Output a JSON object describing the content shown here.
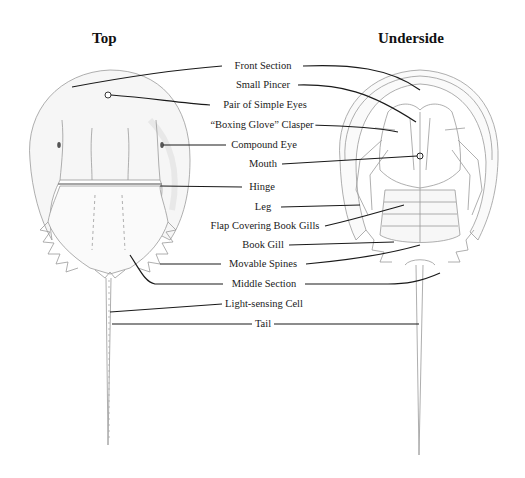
{
  "headings": {
    "top": "Top",
    "underside": "Underside"
  },
  "labels": [
    {
      "id": "front-section",
      "text": "Front Section",
      "x": 263,
      "y": 66
    },
    {
      "id": "small-pincer",
      "text": "Small Pincer",
      "x": 263,
      "y": 85
    },
    {
      "id": "pair-of-simple-eyes",
      "text": "Pair of Simple Eyes",
      "x": 265,
      "y": 105
    },
    {
      "id": "boxing-glove-clasper",
      "text": "“Boxing Glove” Clasper",
      "x": 262,
      "y": 125
    },
    {
      "id": "compound-eye",
      "text": "Compound Eye",
      "x": 264,
      "y": 145
    },
    {
      "id": "mouth",
      "text": "Mouth",
      "x": 263,
      "y": 164
    },
    {
      "id": "hinge",
      "text": "Hinge",
      "x": 262,
      "y": 187
    },
    {
      "id": "leg",
      "text": "Leg",
      "x": 263,
      "y": 207
    },
    {
      "id": "flap-covering-book-gills",
      "text": "Flap Covering Book Gills",
      "x": 265,
      "y": 226
    },
    {
      "id": "book-gill",
      "text": "Book Gill",
      "x": 263,
      "y": 245
    },
    {
      "id": "movable-spines",
      "text": "Movable Spines",
      "x": 263,
      "y": 264
    },
    {
      "id": "middle-section",
      "text": "Middle Section",
      "x": 264,
      "y": 284
    },
    {
      "id": "light-sensing-cell",
      "text": "Light-sensing Cell",
      "x": 264,
      "y": 304
    },
    {
      "id": "tail",
      "text": "Tail",
      "x": 263,
      "y": 324
    }
  ],
  "colors": {
    "ink": "#1a1a1a",
    "sketch": "#9a9a9a",
    "shade": "#ececec"
  }
}
